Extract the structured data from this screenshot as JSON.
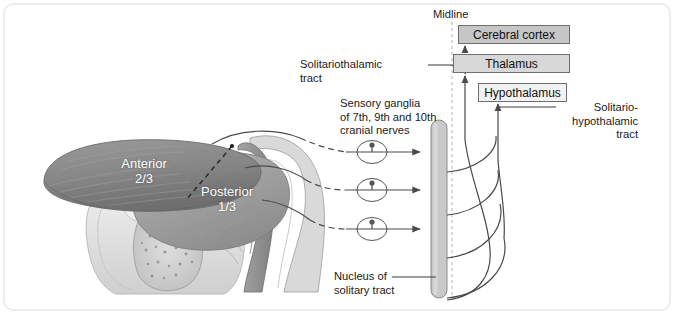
{
  "figure": {
    "background": "#ffffff",
    "frame_color": "#eceded"
  },
  "midline": {
    "label": "Midline",
    "style": "dashed-vertical"
  },
  "boxes": [
    {
      "id": "cerebral-cortex",
      "label": "Cerebral cortex",
      "fill": "#c6c6c6",
      "stroke": "#6e6e6e"
    },
    {
      "id": "thalamus",
      "label": "Thalamus",
      "fill": "#d8d8d8",
      "stroke": "#6e6e6e"
    },
    {
      "id": "hypothalamus",
      "label": "Hypothalamus",
      "fill": "#f2f2f2",
      "stroke": "#6e6e6e"
    }
  ],
  "labels": {
    "solitariothalamic_tract": "Solitariothalamic\ntract",
    "sensory_ganglia": "Sensory ganglia\nof 7th, 9th and 10th\ncranial nerves",
    "solitario_hypothalamic_tract": "Solitario-\nhypothalamic\ntract",
    "nucleus_of_solitary_tract": "Nucleus of\nsolitary tract",
    "anterior": "Anterior\n2/3",
    "posterior": "Posterior\n1/3"
  },
  "structures": {
    "nucleus_bar": {
      "name": "nucleus-of-solitary-tract-bar",
      "fill": "#c9c9c9",
      "stroke": "#8a8a8a"
    },
    "ganglia": [
      {
        "name": "ganglion-7th-cranial-nerve"
      },
      {
        "name": "ganglion-9th-cranial-nerve"
      },
      {
        "name": "ganglion-10th-cranial-nerve"
      }
    ],
    "tongue": {
      "name": "tongue-sagittal-section",
      "regions": [
        "Anterior 2/3",
        "Posterior 1/3"
      ],
      "fill_dark": "#8e8e8e",
      "fill_mid": "#a9a9a9",
      "fill_light": "#d5d5d5"
    },
    "afferent_arrows": 3,
    "efferent_curves": 4
  },
  "colors": {
    "line": "#555555",
    "text": "#1a1a1a",
    "white_text": "#ffffff",
    "midline_dash": "#b9b9b9"
  }
}
